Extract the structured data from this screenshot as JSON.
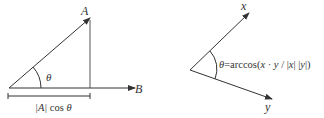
{
  "left_diagram": {
    "vector_a_label": "A",
    "vector_b_label": "B",
    "angle_label": "θ",
    "projection_label_abs": "|A|",
    "projection_label_func": " cos ",
    "projection_label_theta": "θ"
  },
  "right_diagram": {
    "vector_x_label": "x",
    "vector_y_label": "y",
    "formula": {
      "theta": "θ",
      "equals_arccos": "=arccos(",
      "x1": "x",
      "dot": " · ",
      "y1": "y",
      "slash": " / |",
      "x2": "x",
      "mid": "| |",
      "y2": "y",
      "end": "|)"
    }
  },
  "colors": {
    "line": "#333333",
    "background": "#ffffff"
  }
}
